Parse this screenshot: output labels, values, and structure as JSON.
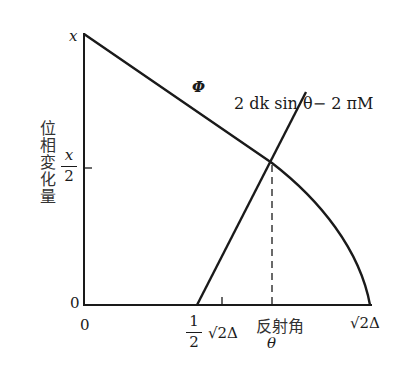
{
  "diagram": {
    "y_axis": {
      "title": "位相変化量",
      "ticks": [
        {
          "label": "x",
          "position": "top"
        },
        {
          "numerator": "x",
          "denominator": "2",
          "position": "middle"
        },
        {
          "label": "0",
          "position": "origin"
        }
      ]
    },
    "x_axis": {
      "title": "反射角",
      "variable": "θ",
      "ticks": [
        {
          "label": "0"
        },
        {
          "coef_num": "1",
          "coef_den": "2",
          "root": "√2Δ"
        },
        {
          "label": "√2Δ"
        }
      ]
    },
    "curves": [
      {
        "name": "Φ",
        "description": "phase shift curve, decreasing from x to 0 at √2Δ"
      },
      {
        "name": "2 dk sin θ − 2 πM",
        "description": "straight line rising from ½√2Δ"
      }
    ],
    "intersection": {
      "y_value": "x/2",
      "marker": "dashed vertical line to θ"
    }
  },
  "labels": {
    "phi": "Φ",
    "line_formula": "2 dk sin θ− 2 πM",
    "y_top": "x",
    "y_mid_num": "x",
    "y_mid_den": "2",
    "y_zero": "0",
    "x_zero": "0",
    "x_half_num": "1",
    "x_half_den": "2",
    "x_half_root": "√2Δ",
    "x_theta_title": "反射角",
    "x_theta": "θ",
    "x_end": "√2Δ",
    "y_title": "位相変化量"
  }
}
